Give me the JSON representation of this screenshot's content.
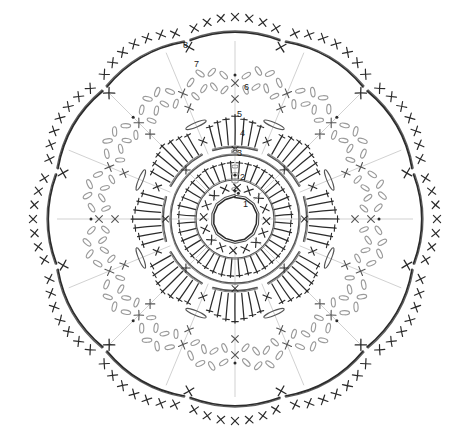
{
  "document": {
    "title": "Crochet Round Motif Chart",
    "type": "crochet-pattern-diagram",
    "background_color": "#ffffff",
    "width": 468,
    "height": 438,
    "center": {
      "x": 235,
      "y": 219
    },
    "symmetry_fold": 8
  },
  "palette": {
    "stitch_dark": "#2b2b2b",
    "stitch_mid": "#555555",
    "chain_light": "#9a9a9a",
    "guide_line": "#bdbdbd",
    "label_text": "#1a1a1a",
    "background": "#ffffff"
  },
  "round_labels": [
    {
      "id": "1",
      "text": "1",
      "x": 243,
      "y": 207
    },
    {
      "id": "2",
      "text": "2",
      "x": 240,
      "y": 180
    },
    {
      "id": "3",
      "text": "3",
      "x": 237,
      "y": 156
    },
    {
      "id": "4",
      "text": "4",
      "x": 240,
      "y": 136
    },
    {
      "id": "5",
      "text": "5",
      "x": 237,
      "y": 117
    },
    {
      "id": "6",
      "text": "6",
      "x": 244,
      "y": 90
    },
    {
      "id": "7",
      "text": "7",
      "x": 194,
      "y": 67
    },
    {
      "id": "8",
      "text": "8",
      "x": 183,
      "y": 48
    }
  ],
  "rounds": [
    {
      "number": 1,
      "name": "magic-ring",
      "stitch": "single-crochet",
      "symbol": "x",
      "radius": 22,
      "count": 16,
      "description": "Magic ring with single crochet stitches"
    },
    {
      "number": 2,
      "name": "chain-spacer",
      "stitch": "chain",
      "symbol": "oval",
      "radius": 36,
      "count": 8,
      "description": "Chain spacer round"
    },
    {
      "number": 3,
      "name": "inner-double-crochet-ring",
      "stitch": "double-crochet",
      "symbol": "T",
      "radius": 58,
      "count": 40,
      "description": "Dense double crochet ring"
    },
    {
      "number": 4,
      "name": "inner-ring-arc",
      "stitch": "slip-arc",
      "symbol": "arc",
      "radius": 64,
      "count": 8,
      "description": "Joining arc ring"
    },
    {
      "number": 5,
      "name": "outer-double-crochet-ring",
      "stitch": "double-crochet",
      "symbol": "T",
      "radius": 104,
      "count": 56,
      "description": "Second dense double crochet fan ring"
    },
    {
      "number": 6,
      "name": "chain-mesh",
      "stitch": "chain-loop",
      "symbol": "wavy",
      "radius": 140,
      "count": 16,
      "description": "Open chain loop mesh round"
    },
    {
      "number": 7,
      "name": "picot-mesh",
      "stitch": "chain-picot",
      "symbol": "wavy",
      "radius": 166,
      "count": 16,
      "description": "Second chain loop / picot mesh round"
    },
    {
      "number": 8,
      "name": "scalloped-border",
      "stitch": "single-crochet-scallop",
      "symbol": "arc-with-x",
      "radius": 196,
      "count": 12,
      "description": "Outer scalloped border arcs edged with single crochet"
    }
  ],
  "legend": {
    "x_symbol": "single crochet",
    "t_symbol": "double crochet",
    "oval_symbol": "chain stitch",
    "arc_symbol": "joining arc"
  }
}
